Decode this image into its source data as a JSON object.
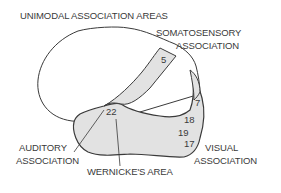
{
  "diagram": {
    "title_label": "UNIMODAL ASSOCIATION AREAS",
    "regions": {
      "somatosensory": {
        "line1": "SOMATOSENSORY",
        "line2": "ASSOCIATION",
        "area": "5"
      },
      "parietal_strip": {
        "area": "7"
      },
      "visual": {
        "line1": "VISUAL",
        "line2": "ASSOCIATION",
        "areas": [
          "18",
          "19",
          "17"
        ]
      },
      "auditory": {
        "line1": "AUDITORY",
        "line2": "ASSOCIATION",
        "area": "22"
      },
      "wernicke": {
        "label": "WERNICKE'S AREA"
      }
    },
    "colors": {
      "outline": "#3a3a3a",
      "shaded_region": "#e2e2e2",
      "text": "#3a3a3a",
      "background": "#ffffff"
    }
  }
}
